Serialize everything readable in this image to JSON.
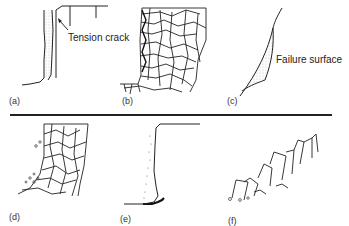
{
  "figure": {
    "panels": [
      {
        "id": "a",
        "label": "(a)",
        "callout": "Tension crack"
      },
      {
        "id": "b",
        "label": "(b)"
      },
      {
        "id": "c",
        "label": "(c)",
        "callout": "Failure surface"
      },
      {
        "id": "d",
        "label": "(d)"
      },
      {
        "id": "e",
        "label": "(e)"
      },
      {
        "id": "f",
        "label": "(f)"
      }
    ],
    "colors": {
      "line": "#222222",
      "stipple": "#9a9a9a",
      "background": "#ffffff"
    }
  }
}
